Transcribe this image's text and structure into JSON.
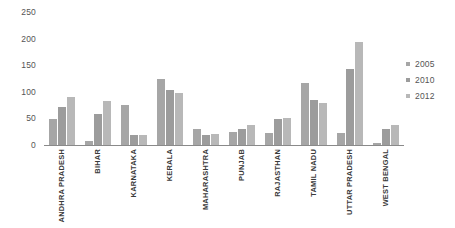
{
  "chart_data": {
    "type": "bar",
    "title": "",
    "xlabel": "",
    "ylabel": "",
    "ylim": [
      0,
      250
    ],
    "yticks": [
      250,
      200,
      150,
      100,
      50,
      0
    ],
    "grid": false,
    "legend_position": "right",
    "categories": [
      "ANDHRA PRADESH",
      "BIHAR",
      "KARNATAKA",
      "KERALA",
      "MAHARASHTRA",
      "PUNJAB",
      "RAJASTHAN",
      "TAMIL NADU",
      "UTTAR PRADESH",
      "WEST BENGAL"
    ],
    "series": [
      {
        "name": "2005",
        "color": "#a6a6a6",
        "values": [
          48,
          8,
          75,
          124,
          30,
          25,
          22,
          117,
          23,
          4
        ]
      },
      {
        "name": "2010",
        "color": "#9c9c9c",
        "values": [
          71,
          59,
          18,
          103,
          19,
          31,
          48,
          85,
          142,
          30
        ]
      },
      {
        "name": "2012",
        "color": "#b8b8b8",
        "values": [
          91,
          83,
          19,
          97,
          20,
          37,
          51,
          79,
          193,
          37
        ]
      }
    ]
  },
  "axis": {
    "baseline_color": "#8a8a8a",
    "tick_label_color": "#555555"
  },
  "legend": {
    "entries": [
      {
        "label": "2005",
        "color": "#a6a6a6"
      },
      {
        "label": "2010",
        "color": "#9c9c9c"
      },
      {
        "label": "2012",
        "color": "#b8b8b8"
      }
    ]
  }
}
